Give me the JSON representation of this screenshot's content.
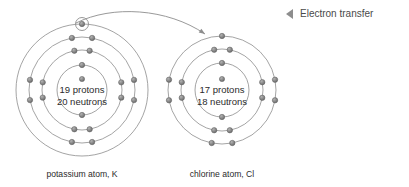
{
  "legend": {
    "marker_icon": "left-triangle-icon",
    "label": "Electron transfer"
  },
  "atoms": [
    {
      "id": "potassium",
      "symbol": "K",
      "caption": "potassium atom, K",
      "nucleus_line1": "19 protons",
      "nucleus_line2": "20 neutrons",
      "protons": 19,
      "neutrons": 20,
      "center": {
        "x": 82,
        "y": 90
      },
      "shell_radii": [
        25,
        40,
        53,
        66
      ],
      "shell_electron_counts": [
        2,
        8,
        8,
        1
      ],
      "total_electrons": 19,
      "highlighted_electron": {
        "shell": 4,
        "position": "top",
        "ring_radius": 6.5
      }
    },
    {
      "id": "chlorine",
      "symbol": "Cl",
      "caption": "chlorine atom, Cl",
      "nucleus_line1": "17 protons",
      "nucleus_line2": "18 neutrons",
      "protons": 17,
      "neutrons": 18,
      "center": {
        "x": 222,
        "y": 90
      },
      "shell_radii": [
        27,
        41,
        54
      ],
      "shell_electron_counts": [
        2,
        8,
        7
      ],
      "total_electrons": 17,
      "highlighted_electron": null
    }
  ],
  "arrow": {
    "name": "electron-transfer-arrow",
    "from_atom": "potassium",
    "to_atom": "chlorine",
    "description": "curved arrow from potassium outer electron to chlorine outer shell"
  },
  "colors": {
    "background": "#ffffff",
    "shell_stroke": "#8d8d8d",
    "electron_fill": "#7c7c7c",
    "electron_highlight": "#a9a9a9",
    "text": "#2b2b2b",
    "legend_text": "#4a4a4a"
  }
}
